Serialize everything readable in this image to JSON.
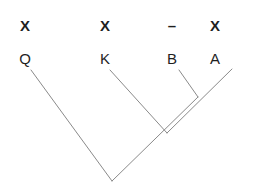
{
  "figure": {
    "type": "cladogram",
    "background_color": "#ffffff",
    "line_color": "#8a8a8a",
    "text_color": "#1f1f1f",
    "width": 255,
    "height": 192
  },
  "leaves": [
    {
      "id": "leaf-q",
      "top_label": "X",
      "bottom_label": "Q",
      "x": 25,
      "label_top_y": 18,
      "label_bottom_y": 51,
      "line_start_x": 31,
      "line_start_y": 70
    },
    {
      "id": "leaf-k",
      "top_label": "X",
      "bottom_label": "K",
      "x": 105,
      "label_top_y": 18,
      "label_bottom_y": 51,
      "line_start_x": 110,
      "line_start_y": 70
    },
    {
      "id": "leaf-b",
      "top_label": "–",
      "bottom_label": "B",
      "x": 172,
      "label_top_y": 18,
      "label_bottom_y": 51,
      "line_start_x": 179,
      "line_start_y": 70
    },
    {
      "id": "leaf-a",
      "top_label": "X",
      "bottom_label": "A",
      "x": 215,
      "label_top_y": 18,
      "label_bottom_y": 51,
      "line_start_x": 232,
      "line_start_y": 69
    }
  ],
  "nodes": [
    {
      "id": "node-ba",
      "label": "B+A junction",
      "x": 198,
      "y": 97
    },
    {
      "id": "node-kba",
      "label": "K+(B+A) junction",
      "x": 167,
      "y": 133
    },
    {
      "id": "node-root",
      "label": "root junction",
      "x": 112,
      "y": 181
    }
  ],
  "branches": [
    {
      "id": "branch-q",
      "x1": 31,
      "y1": 70,
      "x2": 112,
      "y2": 181
    },
    {
      "id": "branch-k",
      "x1": 110,
      "y1": 70,
      "x2": 167,
      "y2": 133
    },
    {
      "id": "branch-b",
      "x1": 179,
      "y1": 70,
      "x2": 198,
      "y2": 97
    },
    {
      "id": "branch-a",
      "x1": 232,
      "y1": 69,
      "x2": 167,
      "y2": 133
    },
    {
      "id": "branch-ba-to-root",
      "x1": 198,
      "y1": 97,
      "x2": 112,
      "y2": 181
    }
  ]
}
